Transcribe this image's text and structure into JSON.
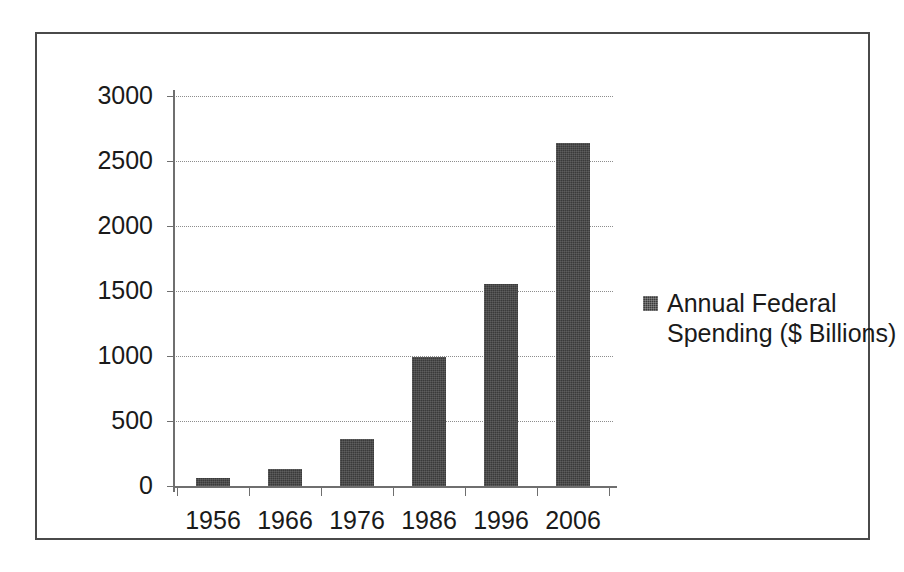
{
  "chart_data": {
    "type": "bar",
    "title": "",
    "xlabel": "",
    "ylabel": "",
    "categories": [
      "1956",
      "1966",
      "1976",
      "1986",
      "1996",
      "2006"
    ],
    "values": [
      62,
      130,
      365,
      990,
      1555,
      2640
    ],
    "series": [
      {
        "name": "Annual Federal Spending ($ Billions)",
        "values": [
          62,
          130,
          365,
          990,
          1555,
          2640
        ]
      }
    ],
    "ylim": [
      0,
      3000
    ],
    "ytick_labels": [
      "3000",
      "2500",
      "2000",
      "1500",
      "1000",
      "500",
      "0"
    ],
    "ytick_values": [
      3000,
      2500,
      2000,
      1500,
      1000,
      500,
      0
    ],
    "grid": true,
    "legend_position": "right",
    "bar_color": "#3a3a3a",
    "axis_color": "#6f6f6f",
    "gridline_color": "#8d8d8d",
    "border_color": "#4a4a4a",
    "background_color": "#ffffff"
  },
  "legend": {
    "label": "Annual Federal Spending ($ Billions)",
    "swatch_name": "legend-swatch-icon"
  }
}
